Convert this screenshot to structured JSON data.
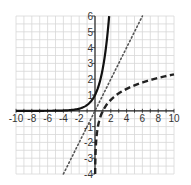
{
  "chart_data": {
    "type": "line",
    "title": "",
    "xlabel": "",
    "ylabel": "",
    "xlim": [
      -10,
      10
    ],
    "ylim": [
      -4,
      6
    ],
    "grid": true,
    "legend": null,
    "x_ticks": [
      -10,
      -8,
      -6,
      -4,
      -2,
      2,
      4,
      6,
      8,
      10
    ],
    "y_ticks": [
      -4,
      -3,
      -2,
      -1,
      1,
      2,
      3,
      4,
      5,
      6
    ],
    "series": [
      {
        "name": "y = e^x",
        "style": "solid",
        "color": "#111111",
        "x": [
          -10,
          -8,
          -6,
          -4,
          -3,
          -2,
          -1,
          -0.5,
          0,
          0.5,
          1,
          1.25,
          1.5,
          1.79
        ],
        "values": [
          5e-05,
          0.0003,
          0.0025,
          0.018,
          0.05,
          0.135,
          0.368,
          0.607,
          1,
          1.649,
          2.718,
          3.49,
          4.482,
          6
        ]
      },
      {
        "name": "y = x",
        "style": "dotted",
        "color": "#555555",
        "x": [
          -4,
          6
        ],
        "values": [
          -4,
          6
        ]
      },
      {
        "name": "y = ln(x)",
        "style": "dashed",
        "color": "#222222",
        "x": [
          0.0183,
          0.05,
          0.1,
          0.2,
          0.3,
          0.5,
          0.75,
          1,
          1.5,
          2,
          3,
          4,
          5,
          6,
          7,
          8,
          9,
          10
        ],
        "values": [
          -4,
          -3,
          -2.303,
          -1.609,
          -1.204,
          -0.693,
          -0.288,
          0,
          0.405,
          0.693,
          1.099,
          1.386,
          1.609,
          1.792,
          1.946,
          2.079,
          2.197,
          2.303
        ]
      }
    ]
  },
  "layout": {
    "plot": {
      "left": 16,
      "right": 174,
      "top": 16,
      "bottom": 174
    },
    "colors": {
      "grid": "#d8d8d8",
      "axis": "#222222",
      "background": "#ffffff"
    }
  }
}
